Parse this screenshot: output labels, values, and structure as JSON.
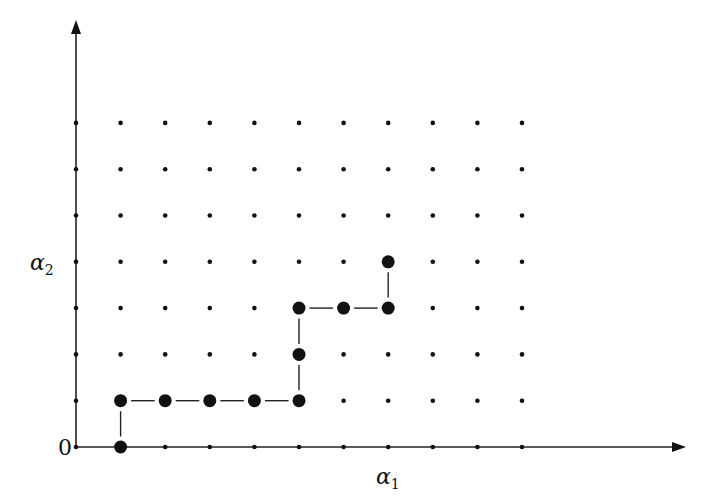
{
  "diagram": {
    "type": "lattice-path",
    "axes": {
      "x_label": "α",
      "x_label_sub": "1",
      "y_label": "α",
      "y_label_sub": "2",
      "origin_label": "0",
      "y_label_row": 4
    },
    "grid": {
      "columns": 11,
      "rows": 8,
      "origin_px": [
        76,
        447
      ],
      "col_spacing_px": 44.6,
      "row_spacing_px": 46.3
    },
    "path": [
      [
        1,
        0
      ],
      [
        1,
        1
      ],
      [
        2,
        1
      ],
      [
        3,
        1
      ],
      [
        4,
        1
      ],
      [
        5,
        1
      ],
      [
        5,
        2
      ],
      [
        5,
        3
      ],
      [
        6,
        3
      ],
      [
        7,
        3
      ],
      [
        7,
        4
      ]
    ],
    "colors": {
      "ink": "#111111",
      "background": "#ffffff"
    }
  }
}
